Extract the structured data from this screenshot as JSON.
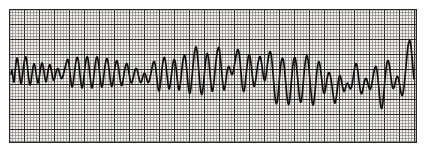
{
  "image": {
    "kind": "ecg-rhythm-strip",
    "width": 425,
    "height": 150,
    "background_color": "#ffffff",
    "description": "Single-lead ECG rhythm strip printed on standard pink-grey graph paper showing a rapid wide-complex polymorphic tachycardia with varying QRS amplitude"
  },
  "grid": {
    "x": 9,
    "y": 9,
    "width": 408,
    "height": 134,
    "paper_color": "#f2f0ef",
    "minor_color": "#6e6a69",
    "major_color": "#272525",
    "border_color": "#2a2828",
    "minor_spacing": 3,
    "major_every": 5,
    "minor_width": 0.55,
    "major_width": 1.05,
    "border_width": 1.2
  },
  "trace": {
    "color": "#111111",
    "width": 1.7,
    "baseline_y": 74,
    "start_x": 11,
    "end_x": 414,
    "points": [
      [
        11,
        74
      ],
      [
        12,
        69
      ],
      [
        13,
        78
      ],
      [
        14,
        84
      ],
      [
        15,
        73
      ],
      [
        16,
        62
      ],
      [
        17,
        57
      ],
      [
        18,
        61
      ],
      [
        19,
        70
      ],
      [
        20,
        79
      ],
      [
        21,
        85
      ],
      [
        22,
        80
      ],
      [
        23,
        71
      ],
      [
        24,
        63
      ],
      [
        25,
        58
      ],
      [
        26,
        56
      ],
      [
        27,
        62
      ],
      [
        28,
        72
      ],
      [
        29,
        81
      ],
      [
        30,
        86
      ],
      [
        31,
        82
      ],
      [
        32,
        74
      ],
      [
        33,
        67
      ],
      [
        34,
        63
      ],
      [
        35,
        66
      ],
      [
        36,
        73
      ],
      [
        37,
        80
      ],
      [
        38,
        84
      ],
      [
        39,
        79
      ],
      [
        40,
        72
      ],
      [
        41,
        66
      ],
      [
        42,
        62
      ],
      [
        43,
        65
      ],
      [
        44,
        72
      ],
      [
        45,
        79
      ],
      [
        46,
        83
      ],
      [
        47,
        78
      ],
      [
        48,
        71
      ],
      [
        49,
        66
      ],
      [
        50,
        64
      ],
      [
        51,
        68
      ],
      [
        52,
        74
      ],
      [
        53,
        79
      ],
      [
        54,
        81
      ],
      [
        55,
        77
      ],
      [
        56,
        72
      ],
      [
        57,
        69
      ],
      [
        58,
        68
      ],
      [
        59,
        71
      ],
      [
        60,
        75
      ],
      [
        61,
        78
      ],
      [
        62,
        79
      ],
      [
        63,
        76
      ],
      [
        64,
        72
      ],
      [
        65,
        68
      ],
      [
        66,
        64
      ],
      [
        67,
        60
      ],
      [
        68,
        59
      ],
      [
        69,
        64
      ],
      [
        70,
        73
      ],
      [
        71,
        82
      ],
      [
        72,
        88
      ],
      [
        73,
        85
      ],
      [
        74,
        77
      ],
      [
        75,
        68
      ],
      [
        76,
        61
      ],
      [
        77,
        57
      ],
      [
        78,
        58
      ],
      [
        79,
        65
      ],
      [
        80,
        75
      ],
      [
        81,
        84
      ],
      [
        82,
        89
      ],
      [
        83,
        85
      ],
      [
        84,
        76
      ],
      [
        85,
        67
      ],
      [
        86,
        60
      ],
      [
        87,
        56
      ],
      [
        88,
        58
      ],
      [
        89,
        66
      ],
      [
        90,
        76
      ],
      [
        91,
        85
      ],
      [
        92,
        89
      ],
      [
        93,
        84
      ],
      [
        94,
        75
      ],
      [
        95,
        66
      ],
      [
        96,
        59
      ],
      [
        97,
        56
      ],
      [
        98,
        59
      ],
      [
        99,
        67
      ],
      [
        100,
        77
      ],
      [
        101,
        85
      ],
      [
        102,
        88
      ],
      [
        103,
        83
      ],
      [
        104,
        74
      ],
      [
        105,
        66
      ],
      [
        106,
        60
      ],
      [
        107,
        58
      ],
      [
        108,
        61
      ],
      [
        109,
        69
      ],
      [
        110,
        78
      ],
      [
        111,
        85
      ],
      [
        112,
        87
      ],
      [
        113,
        82
      ],
      [
        114,
        74
      ],
      [
        115,
        67
      ],
      [
        116,
        62
      ],
      [
        117,
        60
      ],
      [
        118,
        64
      ],
      [
        119,
        71
      ],
      [
        120,
        79
      ],
      [
        121,
        85
      ],
      [
        122,
        86
      ],
      [
        123,
        81
      ],
      [
        124,
        74
      ],
      [
        125,
        68
      ],
      [
        126,
        64
      ],
      [
        127,
        63
      ],
      [
        128,
        67
      ],
      [
        129,
        73
      ],
      [
        130,
        79
      ],
      [
        131,
        83
      ],
      [
        132,
        83
      ],
      [
        133,
        79
      ],
      [
        134,
        74
      ],
      [
        135,
        70
      ],
      [
        136,
        68
      ],
      [
        137,
        69
      ],
      [
        138,
        73
      ],
      [
        139,
        78
      ],
      [
        140,
        82
      ],
      [
        141,
        83
      ],
      [
        142,
        80
      ],
      [
        143,
        76
      ],
      [
        144,
        73
      ],
      [
        145,
        73
      ],
      [
        146,
        76
      ],
      [
        147,
        80
      ],
      [
        148,
        83
      ],
      [
        149,
        82
      ],
      [
        150,
        78
      ],
      [
        151,
        73
      ],
      [
        152,
        68
      ],
      [
        153,
        63
      ],
      [
        154,
        61
      ],
      [
        155,
        63
      ],
      [
        156,
        70
      ],
      [
        157,
        80
      ],
      [
        158,
        88
      ],
      [
        159,
        92
      ],
      [
        160,
        88
      ],
      [
        161,
        79
      ],
      [
        162,
        69
      ],
      [
        163,
        61
      ],
      [
        164,
        57
      ],
      [
        165,
        58
      ],
      [
        166,
        65
      ],
      [
        167,
        75
      ],
      [
        168,
        84
      ],
      [
        169,
        90
      ],
      [
        170,
        87
      ],
      [
        171,
        79
      ],
      [
        172,
        70
      ],
      [
        173,
        63
      ],
      [
        174,
        59
      ],
      [
        175,
        60
      ],
      [
        176,
        67
      ],
      [
        177,
        77
      ],
      [
        178,
        86
      ],
      [
        179,
        91
      ],
      [
        180,
        87
      ],
      [
        181,
        78
      ],
      [
        182,
        68
      ],
      [
        183,
        60
      ],
      [
        184,
        55
      ],
      [
        185,
        55
      ],
      [
        186,
        62
      ],
      [
        187,
        73
      ],
      [
        188,
        84
      ],
      [
        189,
        92
      ],
      [
        190,
        94
      ],
      [
        191,
        88
      ],
      [
        192,
        77
      ],
      [
        193,
        66
      ],
      [
        194,
        56
      ],
      [
        195,
        49
      ],
      [
        196,
        46
      ],
      [
        197,
        50
      ],
      [
        198,
        61
      ],
      [
        199,
        74
      ],
      [
        200,
        86
      ],
      [
        201,
        94
      ],
      [
        202,
        95
      ],
      [
        203,
        89
      ],
      [
        204,
        78
      ],
      [
        205,
        67
      ],
      [
        206,
        58
      ],
      [
        207,
        53
      ],
      [
        208,
        54
      ],
      [
        209,
        62
      ],
      [
        210,
        74
      ],
      [
        211,
        85
      ],
      [
        212,
        92
      ],
      [
        213,
        90
      ],
      [
        214,
        82
      ],
      [
        215,
        71
      ],
      [
        216,
        61
      ],
      [
        217,
        53
      ],
      [
        218,
        48
      ],
      [
        219,
        47
      ],
      [
        220,
        53
      ],
      [
        221,
        64
      ],
      [
        222,
        76
      ],
      [
        223,
        86
      ],
      [
        224,
        91
      ],
      [
        225,
        88
      ],
      [
        226,
        80
      ],
      [
        227,
        72
      ],
      [
        228,
        67
      ],
      [
        229,
        66
      ],
      [
        230,
        69
      ],
      [
        231,
        73
      ],
      [
        232,
        75
      ],
      [
        233,
        73
      ],
      [
        234,
        68
      ],
      [
        235,
        62
      ],
      [
        236,
        56
      ],
      [
        237,
        51
      ],
      [
        238,
        49
      ],
      [
        239,
        52
      ],
      [
        240,
        61
      ],
      [
        241,
        73
      ],
      [
        242,
        84
      ],
      [
        243,
        91
      ],
      [
        244,
        92
      ],
      [
        245,
        86
      ],
      [
        246,
        76
      ],
      [
        247,
        66
      ],
      [
        248,
        58
      ],
      [
        249,
        54
      ],
      [
        250,
        56
      ],
      [
        251,
        63
      ],
      [
        252,
        73
      ],
      [
        253,
        82
      ],
      [
        254,
        87
      ],
      [
        255,
        85
      ],
      [
        256,
        78
      ],
      [
        257,
        70
      ],
      [
        258,
        63
      ],
      [
        259,
        58
      ],
      [
        260,
        56
      ],
      [
        261,
        59
      ],
      [
        262,
        66
      ],
      [
        263,
        74
      ],
      [
        264,
        80
      ],
      [
        265,
        81
      ],
      [
        266,
        76
      ],
      [
        267,
        68
      ],
      [
        268,
        60
      ],
      [
        269,
        54
      ],
      [
        270,
        51
      ],
      [
        271,
        53
      ],
      [
        272,
        61
      ],
      [
        273,
        73
      ],
      [
        274,
        86
      ],
      [
        275,
        97
      ],
      [
        276,
        104
      ],
      [
        277,
        104
      ],
      [
        278,
        96
      ],
      [
        279,
        84
      ],
      [
        280,
        72
      ],
      [
        281,
        63
      ],
      [
        282,
        58
      ],
      [
        283,
        58
      ],
      [
        284,
        64
      ],
      [
        285,
        74
      ],
      [
        286,
        86
      ],
      [
        287,
        97
      ],
      [
        288,
        104
      ],
      [
        289,
        105
      ],
      [
        290,
        98
      ],
      [
        291,
        86
      ],
      [
        292,
        74
      ],
      [
        293,
        64
      ],
      [
        294,
        58
      ],
      [
        295,
        57
      ],
      [
        296,
        62
      ],
      [
        297,
        71
      ],
      [
        298,
        82
      ],
      [
        299,
        93
      ],
      [
        300,
        101
      ],
      [
        301,
        103
      ],
      [
        302,
        97
      ],
      [
        303,
        86
      ],
      [
        304,
        74
      ],
      [
        305,
        64
      ],
      [
        306,
        57
      ],
      [
        307,
        55
      ],
      [
        308,
        59
      ],
      [
        309,
        69
      ],
      [
        310,
        81
      ],
      [
        311,
        93
      ],
      [
        312,
        102
      ],
      [
        313,
        106
      ],
      [
        314,
        102
      ],
      [
        315,
        92
      ],
      [
        316,
        80
      ],
      [
        317,
        70
      ],
      [
        318,
        63
      ],
      [
        319,
        61
      ],
      [
        320,
        65
      ],
      [
        321,
        73
      ],
      [
        322,
        82
      ],
      [
        323,
        90
      ],
      [
        324,
        94
      ],
      [
        325,
        92
      ],
      [
        326,
        86
      ],
      [
        327,
        79
      ],
      [
        328,
        74
      ],
      [
        329,
        72
      ],
      [
        330,
        74
      ],
      [
        331,
        79
      ],
      [
        332,
        86
      ],
      [
        333,
        94
      ],
      [
        334,
        101
      ],
      [
        335,
        104
      ],
      [
        336,
        100
      ],
      [
        337,
        92
      ],
      [
        338,
        83
      ],
      [
        339,
        77
      ],
      [
        340,
        75
      ],
      [
        341,
        78
      ],
      [
        342,
        84
      ],
      [
        343,
        89
      ],
      [
        344,
        92
      ],
      [
        345,
        90
      ],
      [
        346,
        86
      ],
      [
        347,
        83
      ],
      [
        348,
        83
      ],
      [
        349,
        86
      ],
      [
        350,
        89
      ],
      [
        351,
        89
      ],
      [
        352,
        85
      ],
      [
        353,
        79
      ],
      [
        354,
        72
      ],
      [
        355,
        66
      ],
      [
        356,
        63
      ],
      [
        357,
        65
      ],
      [
        358,
        72
      ],
      [
        359,
        81
      ],
      [
        360,
        89
      ],
      [
        361,
        94
      ],
      [
        362,
        94
      ],
      [
        363,
        89
      ],
      [
        364,
        83
      ],
      [
        365,
        79
      ],
      [
        366,
        78
      ],
      [
        367,
        80
      ],
      [
        368,
        84
      ],
      [
        369,
        88
      ],
      [
        370,
        90
      ],
      [
        371,
        88
      ],
      [
        372,
        83
      ],
      [
        373,
        77
      ],
      [
        374,
        71
      ],
      [
        375,
        67
      ],
      [
        376,
        66
      ],
      [
        377,
        70
      ],
      [
        378,
        79
      ],
      [
        379,
        90
      ],
      [
        380,
        101
      ],
      [
        381,
        108
      ],
      [
        382,
        109
      ],
      [
        383,
        102
      ],
      [
        384,
        91
      ],
      [
        385,
        79
      ],
      [
        386,
        69
      ],
      [
        387,
        62
      ],
      [
        388,
        60
      ],
      [
        389,
        63
      ],
      [
        390,
        70
      ],
      [
        391,
        78
      ],
      [
        392,
        85
      ],
      [
        393,
        89
      ],
      [
        394,
        88
      ],
      [
        395,
        84
      ],
      [
        396,
        79
      ],
      [
        397,
        76
      ],
      [
        398,
        77
      ],
      [
        399,
        81
      ],
      [
        400,
        87
      ],
      [
        401,
        93
      ],
      [
        402,
        96
      ],
      [
        403,
        94
      ],
      [
        404,
        87
      ],
      [
        405,
        77
      ],
      [
        406,
        66
      ],
      [
        407,
        55
      ],
      [
        408,
        46
      ],
      [
        409,
        41
      ],
      [
        410,
        40
      ],
      [
        411,
        46
      ],
      [
        412,
        57
      ],
      [
        413,
        69
      ],
      [
        414,
        79
      ]
    ]
  }
}
